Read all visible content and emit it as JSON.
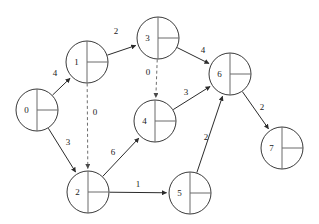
{
  "diagram": {
    "type": "node-link-graph",
    "width": 319,
    "height": 224,
    "background_color": "#ffffff",
    "node_stroke_color": "#3a3a3a",
    "edge_stroke_color": "#2b2b2b",
    "dashed_edge_color": "#6e6e6e",
    "label_color": "#1a1a1a",
    "node_radius": 21,
    "nodes": [
      {
        "id": "0",
        "label": "0",
        "cx": 37,
        "cy": 110,
        "r": 21
      },
      {
        "id": "1",
        "label": "1",
        "cx": 87,
        "cy": 62,
        "r": 21
      },
      {
        "id": "2",
        "label": "2",
        "cx": 88,
        "cy": 192,
        "r": 21
      },
      {
        "id": "3",
        "label": "3",
        "cx": 158,
        "cy": 38,
        "r": 21
      },
      {
        "id": "4",
        "label": "4",
        "cx": 155,
        "cy": 121,
        "r": 21
      },
      {
        "id": "5",
        "label": "5",
        "cx": 190,
        "cy": 193,
        "r": 21
      },
      {
        "id": "6",
        "label": "6",
        "cx": 230,
        "cy": 74,
        "r": 21
      },
      {
        "id": "7",
        "label": "7",
        "cx": 282,
        "cy": 148,
        "r": 21
      }
    ],
    "edges": [
      {
        "from": "0",
        "to": "1",
        "weight": "4",
        "style": "solid",
        "lx": 55,
        "ly": 73
      },
      {
        "from": "0",
        "to": "2",
        "weight": "3",
        "style": "solid",
        "lx": 68,
        "ly": 142
      },
      {
        "from": "1",
        "to": "3",
        "weight": "2",
        "style": "solid",
        "lx": 116,
        "ly": 31
      },
      {
        "from": "1",
        "to": "2",
        "weight": "0",
        "style": "dashed",
        "lx": 95,
        "ly": 112
      },
      {
        "from": "3",
        "to": "6",
        "weight": "4",
        "style": "solid",
        "lx": 203,
        "ly": 50
      },
      {
        "from": "3",
        "to": "4",
        "weight": "0",
        "style": "dashed",
        "lx": 148,
        "ly": 72
      },
      {
        "from": "2",
        "to": "4",
        "weight": "6",
        "style": "solid",
        "lx": 113,
        "ly": 152
      },
      {
        "from": "2",
        "to": "5",
        "weight": "1",
        "style": "solid",
        "lx": 138,
        "ly": 184
      },
      {
        "from": "4",
        "to": "6",
        "weight": "3",
        "style": "solid",
        "lx": 186,
        "ly": 92
      },
      {
        "from": "5",
        "to": "6",
        "weight": "2",
        "style": "solid",
        "lx": 206,
        "ly": 137
      },
      {
        "from": "6",
        "to": "7",
        "weight": "2",
        "style": "solid",
        "lx": 262,
        "ly": 107
      }
    ]
  }
}
